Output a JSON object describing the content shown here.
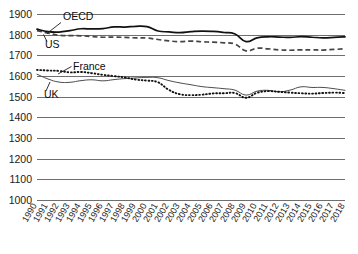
{
  "chart_data": {
    "type": "line",
    "title": "",
    "subtitle": "",
    "xlabel": "",
    "ylabel": "",
    "xlim": [
      1990,
      2018
    ],
    "ylim": [
      1000,
      1900
    ],
    "yticks": [
      1000,
      1100,
      1200,
      1300,
      1400,
      1500,
      1600,
      1700,
      1800,
      1900
    ],
    "grid": true,
    "legend_position": "inline-annotations",
    "x": [
      1990,
      1991,
      1992,
      1993,
      1994,
      1995,
      1996,
      1997,
      1998,
      1999,
      2000,
      2001,
      2002,
      2003,
      2004,
      2005,
      2006,
      2007,
      2008,
      2009,
      2010,
      2011,
      2012,
      2013,
      2014,
      2015,
      2016,
      2017,
      2018
    ],
    "xticklabels": [
      "1990",
      "1991",
      "1992",
      "1993",
      "1994",
      "1995",
      "1996",
      "1997",
      "1998",
      "1999",
      "2000",
      "2001",
      "2002",
      "2003",
      "2004",
      "2005",
      "2006",
      "2007",
      "2008",
      "2009",
      "2010",
      "2011",
      "2012",
      "2013",
      "2014",
      "2015",
      "2016",
      "2017",
      "2018"
    ],
    "series": [
      {
        "name": "US",
        "style": "solid",
        "color": "#111111",
        "values": [
          1829,
          1817,
          1815,
          1822,
          1831,
          1830,
          1832,
          1840,
          1839,
          1843,
          1841,
          1820,
          1816,
          1812,
          1817,
          1820,
          1818,
          1813,
          1806,
          1769,
          1787,
          1792,
          1791,
          1789,
          1793,
          1790,
          1787,
          1789,
          1792
        ]
      },
      {
        "name": "OECD",
        "style": "dashed",
        "color": "#444444",
        "values": [
          1822,
          1810,
          1800,
          1798,
          1797,
          1793,
          1790,
          1791,
          1789,
          1787,
          1786,
          1779,
          1772,
          1769,
          1771,
          1768,
          1766,
          1763,
          1757,
          1724,
          1737,
          1734,
          1729,
          1727,
          1729,
          1729,
          1728,
          1731,
          1734
        ]
      },
      {
        "name": "France",
        "style": "dotted",
        "color": "#111111",
        "values": [
          1632,
          1629,
          1627,
          1620,
          1622,
          1616,
          1608,
          1602,
          1595,
          1585,
          1580,
          1572,
          1535,
          1514,
          1510,
          1512,
          1518,
          1519,
          1520,
          1497,
          1521,
          1529,
          1526,
          1522,
          1519,
          1517,
          1520,
          1522,
          1520
        ]
      },
      {
        "name": "UK",
        "style": "solid-thin",
        "color": "#4d4d4d",
        "values": [
          1611,
          1588,
          1573,
          1572,
          1580,
          1584,
          1579,
          1585,
          1590,
          1593,
          1596,
          1594,
          1580,
          1569,
          1560,
          1551,
          1546,
          1541,
          1534,
          1510,
          1529,
          1533,
          1526,
          1534,
          1550,
          1547,
          1547,
          1541,
          1533
        ]
      }
    ],
    "annotations": [
      {
        "label": "OECD",
        "x_px": 63,
        "y_px": 20
      },
      {
        "label": "US",
        "x_px": 45,
        "y_px": 48
      },
      {
        "label": "France",
        "x_px": 73,
        "y_px": 70
      },
      {
        "label": "UK",
        "x_px": 44,
        "y_px": 98
      }
    ]
  }
}
